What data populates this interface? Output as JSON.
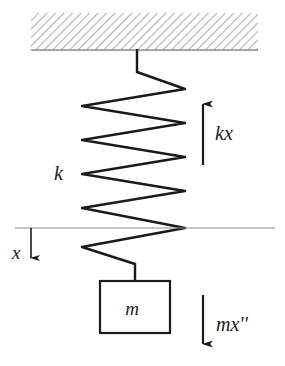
{
  "figure": {
    "kind": "free-body-diagram",
    "background_color": "#ffffff",
    "stroke_color": "#1a1a1a",
    "hatch_color": "#b0b0b0",
    "reference_line_color": "#8c8c8c"
  },
  "labels": {
    "spring_constant": "k",
    "spring_force": "kx",
    "mass": "m",
    "inertial_force": "mx''",
    "displacement": "x"
  },
  "components": {
    "ceiling": {
      "name": "fixed support",
      "hatch_angle_deg": 45,
      "x": 31,
      "y": 13,
      "width": 227,
      "height": 37
    },
    "spring": {
      "name": "helical spring",
      "coil_count": 6,
      "left_x": 82,
      "right_x": 185,
      "top_y": 72,
      "bottom_y": 264
    },
    "mass_block": {
      "name": "mass block",
      "x": 100,
      "y": 281,
      "width": 70,
      "height": 52
    },
    "reference_line": {
      "name": "equilibrium reference line",
      "x1": 15,
      "x2": 275,
      "y": 228
    }
  },
  "arrows": {
    "spring_force": {
      "direction": "up",
      "x": 203,
      "y_tail": 165,
      "y_head": 100,
      "label": "kx"
    },
    "inertial_force": {
      "direction": "down",
      "x": 203,
      "y_tail": 295,
      "y_head": 348,
      "label": "mx''"
    },
    "displacement": {
      "direction": "down",
      "x": 31,
      "y_tail": 228,
      "y_head": 262,
      "label": "x"
    }
  }
}
